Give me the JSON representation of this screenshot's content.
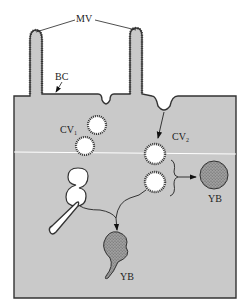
{
  "diagram": {
    "title": "",
    "colors": {
      "cytoplasm": "#c9c9c9",
      "membrane": "#333333",
      "background": "#ffffff",
      "vesicle_lumen": "#ffffff",
      "yolk_body": "#8f8f8f"
    },
    "labels": {
      "microvilli": "MV",
      "bristle_coat": "BC",
      "coated_vesicle_1": "CV",
      "coated_vesicle_1_sub": "1",
      "coated_vesicle_2": "CV",
      "coated_vesicle_2_sub": "2",
      "yolk_body_right": "YB",
      "yolk_body_bottom": "YB"
    },
    "nodes": [
      {
        "id": "MV",
        "label": "MV",
        "desc": "microvilli (two projections)"
      },
      {
        "id": "BC",
        "label": "BC",
        "desc": "bristle coat on membrane"
      },
      {
        "id": "CV1",
        "label": "CV1",
        "desc": "coated vesicles"
      },
      {
        "id": "CV2",
        "label": "CV2",
        "desc": "coated vesicles from invagination"
      },
      {
        "id": "tubule",
        "label": "",
        "desc": "tubular vesicle"
      },
      {
        "id": "fused",
        "label": "",
        "desc": "fused vesicle pair"
      },
      {
        "id": "YB_right",
        "label": "YB",
        "desc": "yolk body"
      },
      {
        "id": "YB_bottom",
        "label": "YB",
        "desc": "yolk body with tail"
      }
    ],
    "edges": [
      {
        "from": "invagination",
        "to": "CV2"
      },
      {
        "from": "CV2",
        "to": "YB_right"
      },
      {
        "from": "CV2",
        "to": "YB_bottom"
      },
      {
        "from": "tubule",
        "to": "YB_bottom"
      }
    ]
  }
}
